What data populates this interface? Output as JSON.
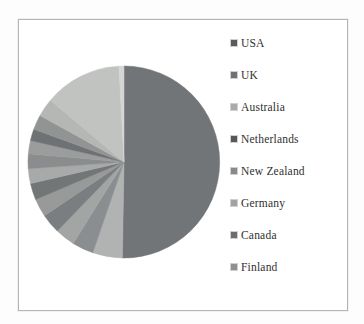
{
  "window": {
    "background_color": "#fdfdfd",
    "chart_frame_color": "#ffffff",
    "chart_frame_border_color": "#b5b5b5"
  },
  "chart_data": {
    "type": "pie",
    "title": "",
    "legend_position": "right",
    "start_angle_deg": 0,
    "direction": "clockwise",
    "center": {
      "cx": 124,
      "cy": 162,
      "r": 96
    },
    "slices": [
      {
        "label": "USA",
        "angle_deg": 181,
        "percent": 50.3,
        "color": "#717577"
      },
      {
        "label": "UK",
        "angle_deg": 18,
        "percent": 5.0,
        "color": "#b0b3b1"
      },
      {
        "label": "Australia",
        "angle_deg": 13,
        "percent": 3.6,
        "color": "#8b8e90"
      },
      {
        "label": "Netherlands",
        "angle_deg": 12,
        "percent": 3.3,
        "color": "#a3a5a4"
      },
      {
        "label": "New Zealand",
        "angle_deg": 12,
        "percent": 3.3,
        "color": "#7b7e80"
      },
      {
        "label": "Germany",
        "angle_deg": 11,
        "percent": 3.1,
        "color": "#989a99"
      },
      {
        "label": "Canada",
        "angle_deg": 10,
        "percent": 2.8,
        "color": "#737677"
      },
      {
        "label": "Finland",
        "angle_deg": 9,
        "percent": 2.5,
        "color": "#a8aaa9"
      },
      {
        "label": "",
        "angle_deg": 9,
        "percent": 2.5,
        "color": "#8a8c8d"
      },
      {
        "label": "",
        "angle_deg": 8,
        "percent": 2.2,
        "color": "#9b9d9c"
      },
      {
        "label": "",
        "angle_deg": 7,
        "percent": 1.9,
        "color": "#6f7274"
      },
      {
        "label": "",
        "angle_deg": 9,
        "percent": 2.5,
        "color": "#929493"
      },
      {
        "label": "",
        "angle_deg": 11,
        "percent": 3.1,
        "color": "#b5b7b5"
      },
      {
        "label": "",
        "angle_deg": 47,
        "percent": 13.1,
        "color": "#c1c3c1"
      },
      {
        "label": "",
        "angle_deg": 3,
        "percent": 0.8,
        "color": "#d4d6d4"
      }
    ]
  },
  "legend": {
    "row_start_y": 43,
    "row_spacing": 32,
    "items": [
      {
        "label": "USA",
        "marker_color": "#5a5b5e"
      },
      {
        "label": "UK",
        "marker_color": "#707173"
      },
      {
        "label": "Australia",
        "marker_color": "#a8aaac"
      },
      {
        "label": "Netherlands",
        "marker_color": "#565759"
      },
      {
        "label": "New Zealand",
        "marker_color": "#88898b"
      },
      {
        "label": "Germany",
        "marker_color": "#a0a2a4"
      },
      {
        "label": "Canada",
        "marker_color": "#6b6c6e"
      },
      {
        "label": "Finland",
        "marker_color": "#8e9092"
      }
    ]
  }
}
